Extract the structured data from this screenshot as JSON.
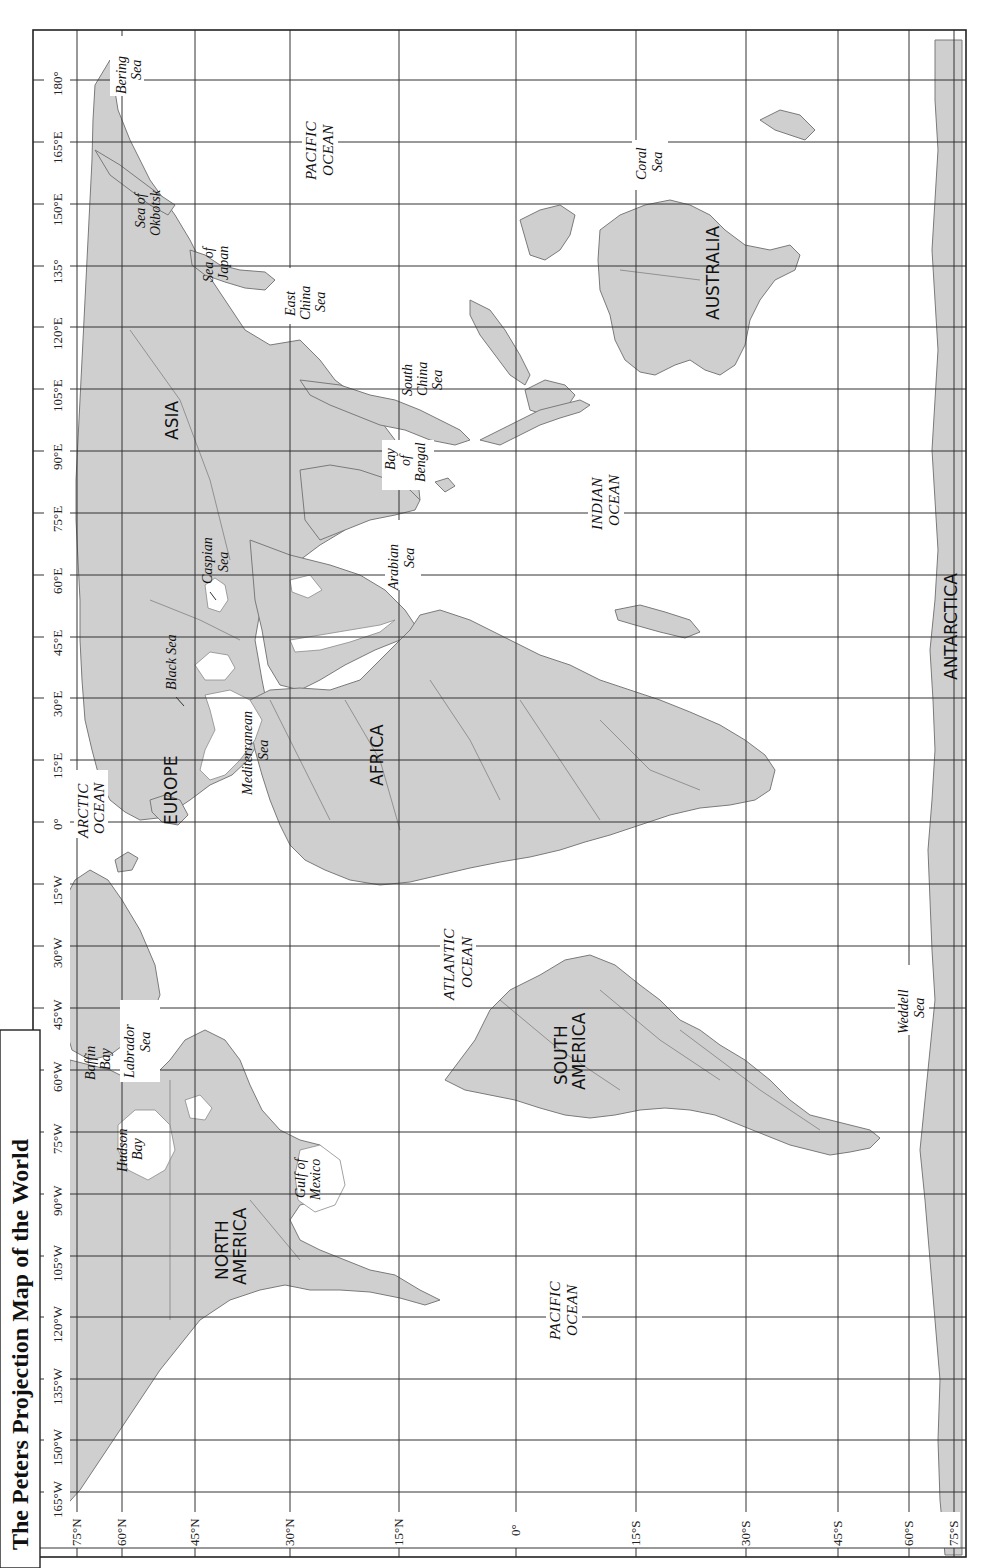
{
  "title": "The Peters Projection Map of the World",
  "orientation": "rotated 90° counter-clockwise",
  "colors": {
    "land": "#cfcfcf",
    "land_outline": "#7a7a7a",
    "water": "#ffffff",
    "grid": "#333333",
    "text": "#111111"
  },
  "longitude_labels": [
    "180°",
    "165°E",
    "150°E",
    "135°",
    "120°E",
    "105°E",
    "90°E",
    "75°E",
    "60°E",
    "45°E",
    "30°E",
    "15°E",
    "0°",
    "15°W",
    "30°W",
    "45°W",
    "60°W",
    "75°W",
    "90°W",
    "105°W",
    "120°W",
    "135°W",
    "150°W",
    "165°W"
  ],
  "latitude_labels": [
    "75°N",
    "60°N",
    "45°N",
    "30°N",
    "15°N",
    "0°",
    "15°S",
    "30°S",
    "45°S",
    "60°S",
    "75°S"
  ],
  "continents": {
    "asia": "ASIA",
    "europe": "EUROPE",
    "africa": "AFRICA",
    "north_america_1": "NORTH",
    "north_america_2": "AMERICA",
    "south_america_1": "SOUTH",
    "south_america_2": "AMERICA",
    "australia": "AUSTRALIA",
    "antarctica": "ANTARCTICA"
  },
  "oceans": {
    "arctic_1": "ARCTIC",
    "arctic_2": "OCEAN",
    "pacific_east_1": "PACIFIC",
    "pacific_east_2": "OCEAN",
    "pacific_west_1": "PACIFIC",
    "pacific_west_2": "OCEAN",
    "atlantic_1": "ATLANTIC",
    "atlantic_2": "OCEAN",
    "indian_1": "INDIAN",
    "indian_2": "OCEAN"
  },
  "seas": {
    "bering_1": "Bering",
    "bering_2": "Sea",
    "okhotsk_1": "Sea of",
    "okhotsk_2": "Okbotsk",
    "japan_1": "Sea of",
    "japan_2": "Japan",
    "east_china_1": "East",
    "east_china_2": "China",
    "east_china_3": "Sea",
    "south_china_1": "South",
    "south_china_2": "China",
    "south_china_3": "Sea",
    "bengal_1": "Bay",
    "bengal_2": "of",
    "bengal_3": "Bengal",
    "arabian_1": "Arabian",
    "arabian_2": "Sea",
    "caspian_1": "Caspian",
    "caspian_2": "Sea",
    "black": "Black Sea",
    "mediterranean_1": "Mediterranean",
    "mediterranean_2": "Sea",
    "coral_1": "Coral",
    "coral_2": "Sea",
    "baffin_1": "Baffin",
    "baffin_2": "Bay",
    "hudson_1": "Hudson",
    "hudson_2": "Bay",
    "labrador_1": "Labrador",
    "labrador_2": "Sea",
    "gulf_mexico_1": "Gulf of",
    "gulf_mexico_2": "Mexico",
    "weddell_1": "Weddell",
    "weddell_2": "Sea"
  }
}
